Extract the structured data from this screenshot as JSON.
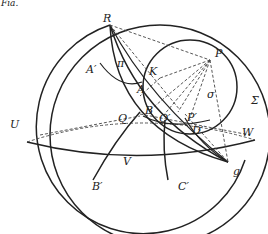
{
  "figure": {
    "top_fragment": "Fia.",
    "labels": {
      "R": "R",
      "P": "P",
      "A_prime": "A′",
      "pi": "π",
      "K": "K",
      "A": "A",
      "sigma": "σ",
      "Sigma": "Σ",
      "U": "U",
      "Q": "Q",
      "B": "B",
      "Q_prime": "Q′",
      "P_prime": "P′",
      "D_prime": "D′",
      "W": "W",
      "V": "V",
      "B_prime": "B′",
      "C_prime": "C′",
      "g": "g"
    },
    "colors": {
      "stroke": "#222222",
      "background": "#ffffff"
    }
  }
}
